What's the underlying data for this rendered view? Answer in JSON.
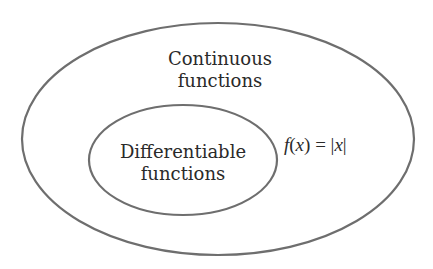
{
  "diagram": {
    "type": "venn-nested-sets",
    "outer_set": {
      "label_line1": "Continuous",
      "label_line2": "functions"
    },
    "inner_set": {
      "label_line1": "Differentiable",
      "label_line2": "functions"
    },
    "example": {
      "f": "f",
      "open": "(",
      "var": "x",
      "close": ")",
      "eq": " = |",
      "var2": "x",
      "end": "|"
    },
    "colors": {
      "stroke": "#6e6e6e",
      "text": "#2a2a2a",
      "background": "#ffffff"
    }
  }
}
